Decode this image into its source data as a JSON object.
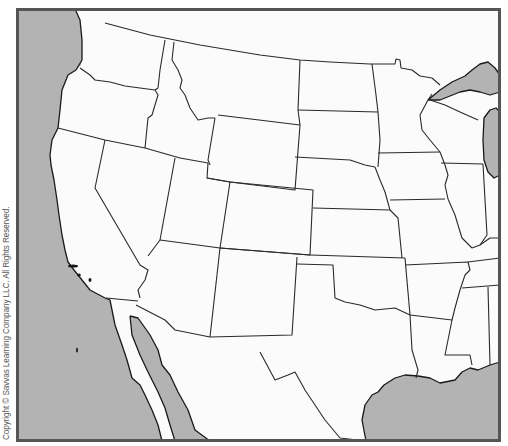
{
  "map": {
    "title": "",
    "copyright": "Copyright © Savvas Learning Company LLC. All Rights Reserved.",
    "colors": {
      "water": "#b3b3b3",
      "land": "#fbfbfb",
      "border": "#2a2a2a",
      "frame": "#555555"
    },
    "regions": [
      "washington",
      "oregon",
      "california",
      "idaho",
      "nevada",
      "montana",
      "wyoming",
      "utah",
      "arizona",
      "colorado",
      "new-mexico",
      "north-dakota",
      "south-dakota",
      "nebraska",
      "kansas",
      "oklahoma",
      "texas",
      "minnesota",
      "iowa",
      "missouri",
      "arkansas",
      "louisiana",
      "wisconsin",
      "illinois",
      "michigan",
      "mississippi",
      "tennessee",
      "kentucky",
      "alabama",
      "indiana",
      "mexico",
      "baja-california",
      "pacific-ocean",
      "gulf-of-mexico",
      "lake-superior",
      "lake-michigan",
      "gulf-of-california"
    ]
  }
}
